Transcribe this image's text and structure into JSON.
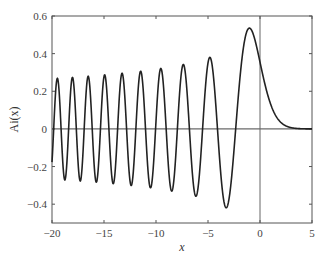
{
  "chart_data": {
    "type": "line",
    "title": "",
    "xlabel": "x",
    "ylabel": "Ai(x)",
    "xlim": [
      -20,
      5
    ],
    "ylim": [
      -0.5,
      0.6
    ],
    "grid": false,
    "legend": null,
    "x_ticks": [
      -20,
      -15,
      -10,
      -5,
      0,
      5
    ],
    "x_tick_labels": [
      "−20",
      "−15",
      "−10",
      "−5",
      "0",
      "5"
    ],
    "y_ticks": [
      -0.4,
      -0.2,
      0,
      0.2,
      0.4,
      0.6
    ],
    "y_tick_labels": [
      "−0.4",
      "−0.2",
      "0",
      "0.2",
      "0.4",
      "0.6"
    ],
    "reference_lines": {
      "horizontal_y": 0,
      "vertical_x": 0
    },
    "series": [
      {
        "name": "Ai(x)",
        "color": "#222222",
        "key_points": {
          "x": [
            -20,
            -19.4876,
            -18.7673,
            -18.0341,
            -17.2857,
            -16.5209,
            -15.7382,
            -14.9359,
            -14.1115,
            -13.2622,
            -12.3848,
            -11.4751,
            -10.5277,
            -9.5354,
            -8.4885,
            -7.3722,
            -6.1633,
            -4.8201,
            -3.2482,
            -1.0188,
            0,
            1,
            2,
            3,
            4,
            5
          ],
          "y": [
            -0.1762,
            0.2835,
            -0.2853,
            0.2872,
            -0.2893,
            0.2916,
            -0.2942,
            0.297,
            -0.3001,
            0.3036,
            -0.3077,
            0.3124,
            -0.3179,
            0.3246,
            -0.3326,
            0.3433,
            -0.3579,
            0.3804,
            -0.419,
            0.5357,
            0.355,
            0.1353,
            0.0349,
            0.0066,
            0.001,
            0.0001
          ]
        }
      }
    ]
  },
  "plot_box": {
    "left": 52,
    "top": 16,
    "right": 312,
    "bottom": 223
  }
}
